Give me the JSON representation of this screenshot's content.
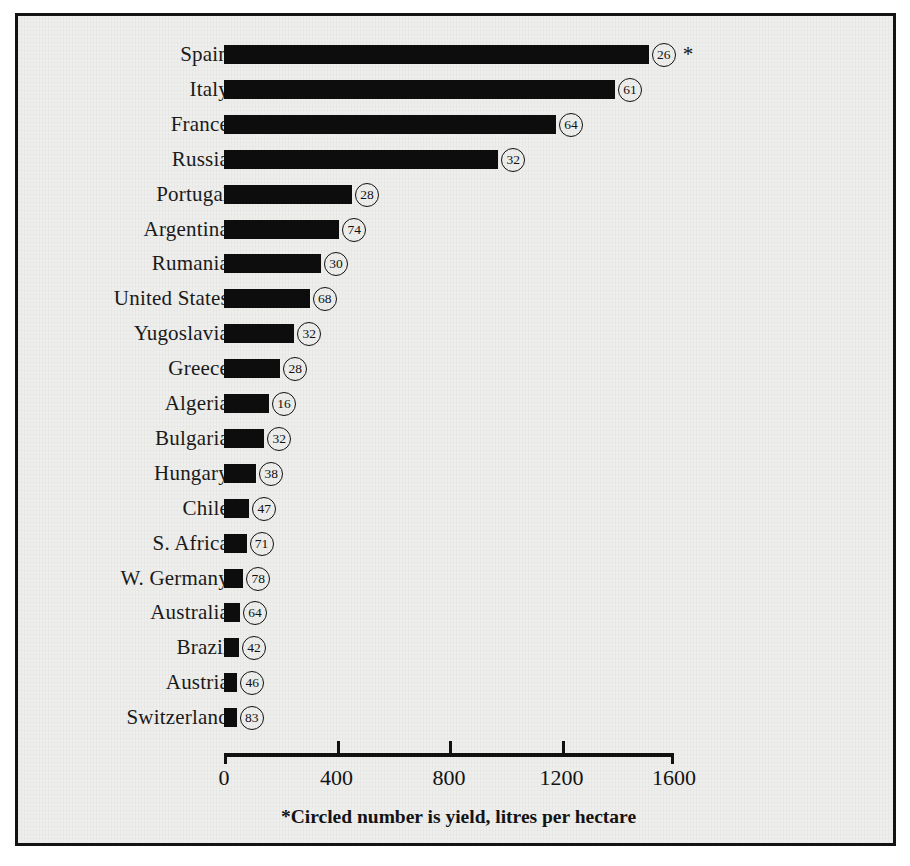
{
  "chart_data": {
    "type": "bar",
    "orientation": "horizontal",
    "title": "",
    "xlabel": "",
    "ylabel": "",
    "xlim": [
      0,
      1600
    ],
    "xticks": [
      "0",
      "400",
      "800",
      "1200",
      "1600"
    ],
    "xtick_values": [
      0,
      400,
      800,
      1200,
      1600
    ],
    "grid": false,
    "legend": null,
    "footnote": "*Circled number is yield, litres per hectare",
    "value_unit": "thousands of hectares",
    "badge_label": "yield, litres per hectare",
    "categories": [
      "Spain",
      "Italy",
      "France",
      "Russia",
      "Portugal",
      "Argentina",
      "Rumania",
      "United States",
      "Yugoslavia",
      "Greece",
      "Algeria",
      "Bulgaria",
      "Hungary",
      "Chile",
      "S. Africa",
      "W. Germany",
      "Australia",
      "Brazil",
      "Austria",
      "Switzerland"
    ],
    "values": [
      1510,
      1390,
      1180,
      975,
      455,
      410,
      345,
      305,
      250,
      200,
      160,
      143,
      115,
      90,
      80,
      68,
      57,
      53,
      47,
      45
    ],
    "yields": [
      26,
      61,
      64,
      32,
      28,
      74,
      30,
      68,
      32,
      28,
      16,
      32,
      38,
      47,
      71,
      78,
      64,
      42,
      46,
      83
    ],
    "notes": [
      "*",
      "",
      "",
      "",
      "",
      "",
      "",
      "",
      "",
      "",
      "",
      "",
      "",
      "",
      "",
      "",
      "",
      "",
      "",
      ""
    ]
  }
}
